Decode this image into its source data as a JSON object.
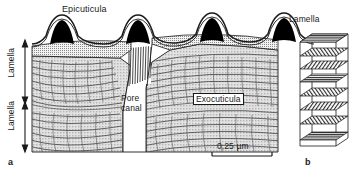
{
  "figure": {
    "type": "scientific-diagram",
    "background": "#ffffff",
    "ink": "#1a1a1a",
    "fill_grey": "#d4d4d4",
    "epicuticle_black": "#000000"
  },
  "panel_a": {
    "caption": "a",
    "labels": {
      "epicuticula": "Epicuticula",
      "pore_canal_line1": "Pore",
      "pore_canal_line2": "canal",
      "exocuticula": "Exocuticula",
      "lamella_upper": "Lamella",
      "lamella_lower": "Lamella"
    },
    "scale_bar": {
      "text": "0,25 µm",
      "value": "0,25",
      "unit": "µm"
    },
    "structure": {
      "crest_count": 4,
      "lamella_bracket_count": 2,
      "pore_canal_count": 1,
      "arc_pattern": "Bouligand parabolic arcs"
    }
  },
  "panel_b": {
    "caption": "b",
    "labels": {
      "lamella": "Lamella"
    },
    "structure": {
      "layer_count": 8,
      "model": "helicoidal stacked lamellae",
      "fiber_orientation": "rotating plywood"
    }
  }
}
